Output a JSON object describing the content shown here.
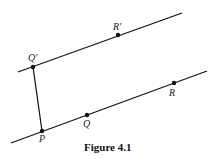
{
  "figure": {
    "caption": "Figure 4.1",
    "labels": {
      "q_prime": "Q′",
      "r_prime": "R′",
      "r": "R",
      "q": "Q",
      "p": "P"
    },
    "colors": {
      "stroke": "#111111",
      "background": "#ffffff"
    }
  }
}
